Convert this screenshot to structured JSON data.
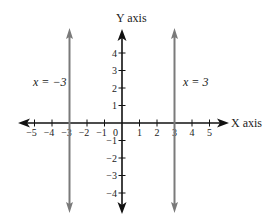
{
  "chart_data": {
    "type": "line",
    "title": "",
    "xlabel": "X axis",
    "ylabel": "Y axis",
    "xlim": [
      -5,
      5
    ],
    "ylim": [
      -4,
      4
    ],
    "grid": false,
    "x_ticks": [
      -5,
      -4,
      -3,
      -2,
      -1,
      1,
      2,
      3,
      4,
      5
    ],
    "y_ticks": [
      -4,
      -3,
      -2,
      -1,
      1,
      2,
      3,
      4
    ],
    "origin_label": "0",
    "series": [
      {
        "name": "x = −3",
        "type": "vertical_line",
        "x": -3,
        "color": "#7a7a7a"
      },
      {
        "name": "x = 3",
        "type": "vertical_line",
        "x": 3,
        "color": "#7a7a7a"
      }
    ],
    "annotations": [
      {
        "text": "x = −3",
        "near_x": -3,
        "y": 2
      },
      {
        "text": "x = 3",
        "near_x": 3,
        "y": 2
      }
    ]
  },
  "labels": {
    "x_axis": "X axis",
    "y_axis": "Y axis",
    "origin": "0",
    "left_line_eq": "x = −3",
    "right_line_eq": "x = 3"
  },
  "colors": {
    "axis": "#111111",
    "vertical_lines": "#7a7a7a",
    "text": "#222222"
  }
}
